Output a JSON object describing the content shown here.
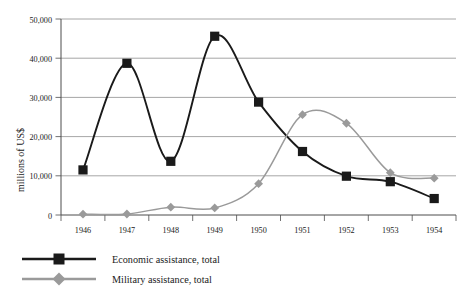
{
  "chart_data": {
    "type": "line",
    "title": "",
    "subtitle": "",
    "xlabel": "",
    "ylabel": "millions of US$",
    "categories": [
      1946,
      1947,
      1948,
      1949,
      1950,
      1951,
      1952,
      1953,
      1954
    ],
    "x_tick_labels": [
      "1946",
      "1947",
      "1948",
      "1949",
      "1950",
      "1951",
      "1952",
      "1953",
      "1954"
    ],
    "y_tick_labels": [
      "0",
      "10,000",
      "20,000",
      "30,000",
      "40,000",
      "50,000"
    ],
    "y_tick_values": [
      0,
      10000,
      20000,
      30000,
      40000,
      50000
    ],
    "ylim": [
      0,
      50000
    ],
    "grid": true,
    "grid_axis": "y",
    "legend_position": "bottom-left",
    "smoothing": "spline",
    "series": [
      {
        "name": "Economic assistance, total",
        "color": "#1a1a1a",
        "marker": "square",
        "values": [
          11500,
          38700,
          13700,
          45600,
          28800,
          16200,
          9900,
          8500,
          4200
        ]
      },
      {
        "name": "Military assistance, total",
        "color": "#9a9a9a",
        "marker": "diamond",
        "values": [
          200,
          250,
          2000,
          1800,
          8000,
          25600,
          23400,
          10800,
          9400
        ]
      }
    ]
  },
  "legend": {
    "items": [
      {
        "label": "Economic assistance, total",
        "color": "#1a1a1a",
        "marker": "square"
      },
      {
        "label": "Military assistance, total",
        "color": "#9a9a9a",
        "marker": "diamond"
      }
    ]
  },
  "colors": {
    "economic": "#1a1a1a",
    "military": "#9a9a9a",
    "gridline": "#8f8f8f",
    "axis": "#4d4d4d",
    "background": "#ffffff"
  }
}
